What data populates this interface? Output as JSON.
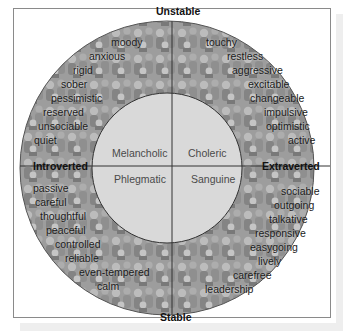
{
  "diagram": {
    "type": "personality-wheel",
    "axes": {
      "top": "Unstable",
      "bottom": "Stable",
      "left": "Introverted",
      "right": "Extraverted"
    },
    "temperaments": {
      "top_left": "Melancholic",
      "top_right": "Choleric",
      "bottom_left": "Phlegmatic",
      "bottom_right": "Sanguine"
    },
    "traits": {
      "unstable_introverted": [
        "moody",
        "anxious",
        "rigid",
        "sober",
        "pessimistic",
        "reserved",
        "unsociable",
        "quiet"
      ],
      "unstable_extraverted": [
        "touchy",
        "restless",
        "aggressive",
        "excitable",
        "changeable",
        "impulsive",
        "optimistic",
        "active"
      ],
      "stable_introverted": [
        "passive",
        "careful",
        "thoughtful",
        "peaceful",
        "controlled",
        "reliable",
        "even-tempered",
        "calm"
      ],
      "stable_extraverted": [
        "sociable",
        "outgoing",
        "talkative",
        "responsive",
        "easygoing",
        "lively",
        "carefree",
        "leadership"
      ]
    },
    "colors": {
      "ring_fill": "#9a9a9a",
      "inner_fill": "#d8d8d8",
      "lines": "#333333",
      "frame": "#8a8a8a"
    }
  }
}
